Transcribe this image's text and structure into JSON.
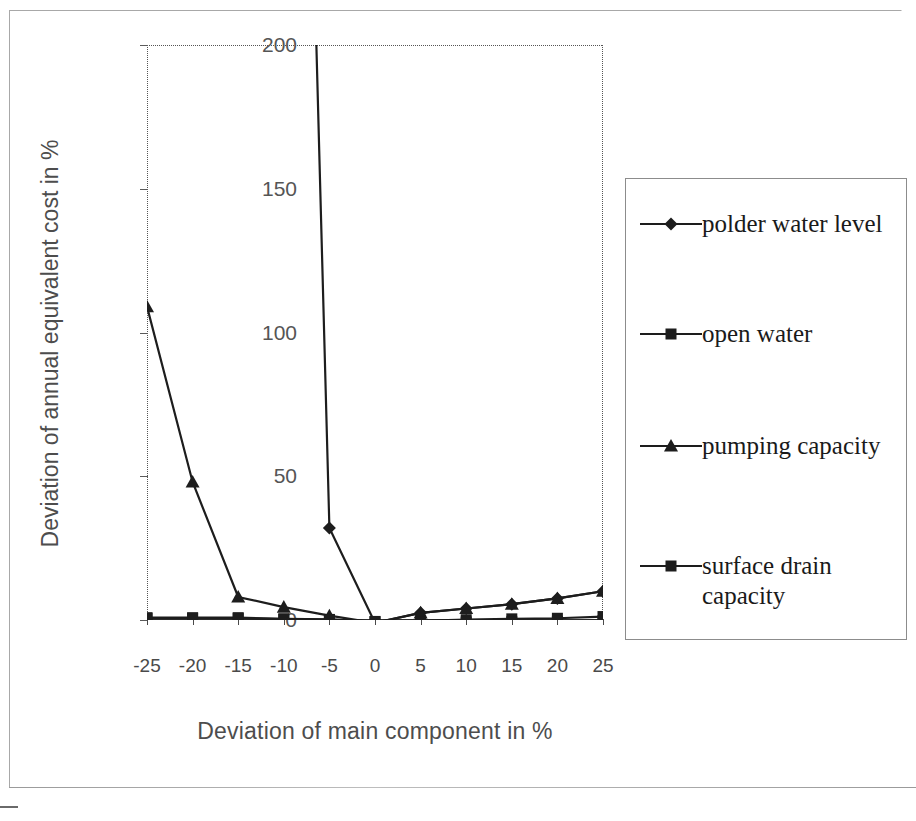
{
  "chart_data": {
    "type": "line",
    "title": "",
    "xlabel": "Deviation of main component in %",
    "ylabel": "Deviation of annual equivalent cost in %",
    "x": [
      -25,
      -20,
      -15,
      -10,
      -5,
      0,
      5,
      10,
      15,
      20,
      25
    ],
    "xticklabels": [
      "-25",
      "-20",
      "-15",
      "-10",
      "-5",
      "0",
      "5",
      "10",
      "15",
      "20",
      "25"
    ],
    "yticklabels": [
      "0",
      "50",
      "100",
      "150",
      "200"
    ],
    "yticks": [
      0,
      50,
      100,
      150,
      200
    ],
    "xlim": [
      -25,
      25
    ],
    "ylim": [
      0,
      200
    ],
    "grid": false,
    "legend_position": "right",
    "series": [
      {
        "name": "polder water level",
        "marker": "diamond",
        "values": [
          null,
          null,
          null,
          620,
          32,
          -1,
          2.5,
          4,
          5.5,
          7.5,
          10
        ],
        "clipped_above": true,
        "note": "rises off the top of the axis left of -5"
      },
      {
        "name": "open water",
        "marker": "square",
        "values": [
          0.8,
          0.8,
          0.8,
          0.4,
          0.2,
          -0.5,
          -0.3,
          0.1,
          0.4,
          0.6,
          1.2
        ]
      },
      {
        "name": "pumping capacity",
        "marker": "triangle",
        "values": [
          109,
          48,
          8,
          4.5,
          1.5,
          -1,
          2.5,
          4,
          5.5,
          7.5,
          10
        ]
      },
      {
        "name": "surface drain capacity",
        "marker": "square",
        "values": [
          0.6,
          0.6,
          0.6,
          0.3,
          0.1,
          -0.6,
          -0.8,
          -0.7,
          -0.6,
          -0.5,
          -0.2
        ]
      }
    ]
  },
  "legend": {
    "entries": [
      {
        "label": "polder water level",
        "marker": "diamond"
      },
      {
        "label": "open water",
        "marker": "square"
      },
      {
        "label": "pumping capacity",
        "marker": "triangle"
      },
      {
        "label": "surface drain\ncapacity",
        "marker": "square"
      }
    ]
  },
  "colors": {
    "line": "#1d1d1d",
    "axis": "#2f2f2f",
    "tick_text": "#4a4a4a",
    "title_text": "#4d4d4d",
    "legend_border": "#8c8c8c",
    "page_frame": "#a8a8a8",
    "background": "#ffffff"
  }
}
